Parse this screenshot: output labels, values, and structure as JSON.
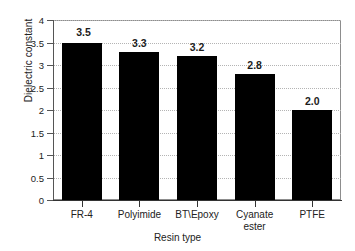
{
  "chart_data": {
    "type": "bar",
    "title": "",
    "subtitle": "",
    "xlabel": "Resin type",
    "ylabel": "Dielectric constant",
    "categories": [
      "FR-4",
      "Polyimide",
      "BT\\Epoxy",
      "Cyanate ester",
      "PTFE"
    ],
    "category_lines": [
      [
        "FR-4"
      ],
      [
        "Polyimide"
      ],
      [
        "BT\\Epoxy"
      ],
      [
        "Cyanate",
        "ester"
      ],
      [
        "PTFE"
      ]
    ],
    "values": [
      3.5,
      3.3,
      3.2,
      2.8,
      2.0
    ],
    "value_labels": [
      "3.5",
      "3.3",
      "3.2",
      "2.8",
      "2.0"
    ],
    "ylim": [
      0,
      4
    ],
    "yticks": [
      0,
      0.5,
      1,
      1.5,
      2,
      2.5,
      3,
      3.5,
      4
    ],
    "ytick_labels": [
      "0",
      "0.5",
      "1",
      "1.5",
      "2",
      "2.5",
      "3",
      "3.5",
      "4"
    ],
    "grid": true,
    "grid_axis": "y",
    "legend": false,
    "bar_color": "#000000",
    "grid_color": "#b4b4b4",
    "axis_color": "#555555",
    "text_color": "#222222"
  }
}
